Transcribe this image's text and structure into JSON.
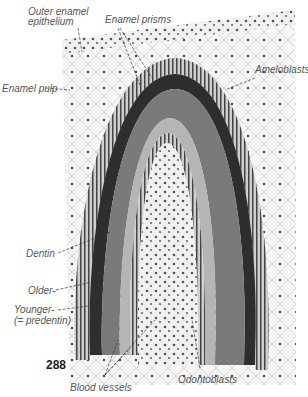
{
  "figure": {
    "number": "288",
    "labels": {
      "outer_enamel_epithelium_1": "Outer enamel",
      "outer_enamel_epithelium_2": "epithelium",
      "enamel_prisms": "Enamel prisms",
      "ameloblasts": "Ameloblasts",
      "enamel_pulp": "Enamel pulp",
      "dentin": "Dentin",
      "older": "Older-",
      "younger_1": "Younger-",
      "younger_2": "(= predentin)",
      "blood_vessels": "Blood vessels",
      "odontoblasts": "Odontoblasts"
    },
    "colors": {
      "enamel_dark": "#2e2e2e",
      "dentin": "#7a7a7a",
      "predentin": "#b5b5b5",
      "pulp": "#e6e6e6",
      "label_text": "#555555"
    }
  }
}
